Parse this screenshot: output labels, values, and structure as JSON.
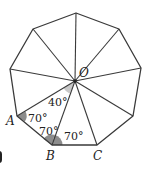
{
  "diagram": {
    "shape": "regular-nonagon",
    "colors": {
      "stroke": "#3a3a3a",
      "angle_dark": "#8c8c8c",
      "angle_light": "#c8c8c8"
    },
    "center": {
      "label": "O",
      "x": 75,
      "y": 81
    },
    "vertices": [
      {
        "id": "top",
        "x": 76,
        "y": 13
      },
      {
        "id": "upper-right",
        "x": 119,
        "y": 29
      },
      {
        "id": "right",
        "x": 141,
        "y": 68
      },
      {
        "id": "lower-right",
        "x": 133,
        "y": 116
      },
      {
        "id": "C",
        "label": "C",
        "x": 97,
        "y": 145
      },
      {
        "id": "B",
        "label": "B",
        "x": 52,
        "y": 145
      },
      {
        "id": "A",
        "label": "A",
        "x": 17,
        "y": 116
      },
      {
        "id": "left",
        "x": 10,
        "y": 69
      },
      {
        "id": "upper-left",
        "x": 33,
        "y": 29
      }
    ],
    "labels": {
      "O": "O",
      "A": "A",
      "B": "B",
      "C": "C"
    },
    "angles": {
      "AOB": "40°",
      "OAB": "70°",
      "OBA": "70°",
      "OBC": "70°"
    }
  }
}
